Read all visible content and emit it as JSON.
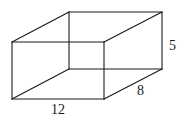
{
  "figure": {
    "type": "rectangular-prism-wireframe",
    "stroke_color": "#1a1a1a",
    "vertices": {
      "front_top_left": [
        12,
        42
      ],
      "front_top_right": [
        104,
        42
      ],
      "front_bottom_left": [
        12,
        99
      ],
      "front_bottom_right": [
        104,
        99
      ],
      "back_top_left": [
        69,
        12
      ],
      "back_top_right": [
        162,
        12
      ],
      "back_bottom_left": [
        69,
        69
      ],
      "back_bottom_right": [
        162,
        69
      ]
    },
    "labels": {
      "length": "12",
      "width": "8",
      "height": "5"
    }
  }
}
